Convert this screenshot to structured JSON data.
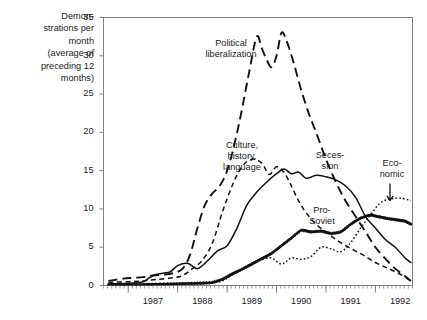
{
  "chart_data": {
    "type": "line",
    "title": "",
    "ylabel": "Demon-strations per month (average of preceding 12 months)",
    "ylabel_lines": [
      "Demon-",
      "strations per",
      "month",
      "(average of",
      "preceding 12",
      "months)"
    ],
    "xlabel": "",
    "ylim": [
      0,
      35
    ],
    "yticks": [
      0,
      5,
      10,
      15,
      20,
      25,
      30,
      35
    ],
    "xlim": [
      1986.5,
      1992.75
    ],
    "xticks": [
      1987,
      1988,
      1989,
      1990,
      1991,
      1992
    ],
    "xtick_labels": [
      "1987",
      "1988",
      "1989",
      "1990",
      "1991",
      "1992"
    ],
    "grid": false,
    "legend_position": "inline-annotations",
    "annotations": [
      {
        "name": "political-liberalization",
        "lines": [
          "Political",
          "liberalization"
        ],
        "x": 231,
        "y": 38
      },
      {
        "name": "culture-history-language",
        "lines": [
          "Culture,",
          "history,",
          "language"
        ],
        "x": 242,
        "y": 140
      },
      {
        "name": "secession",
        "lines": [
          "Seces-",
          "sion"
        ],
        "x": 330,
        "y": 150
      },
      {
        "name": "pro-soviet",
        "lines": [
          "Pro-",
          "Soviet"
        ],
        "x": 322,
        "y": 205
      },
      {
        "name": "economic",
        "lines": [
          "Eco-",
          "nomic"
        ],
        "x": 392,
        "y": 158,
        "arrow": true
      }
    ],
    "series": [
      {
        "name": "Political liberalization",
        "style": "long-dash",
        "x": [
          1986.6,
          1986.9,
          1987.1,
          1987.3,
          1987.5,
          1987.7,
          1987.9,
          1988.1,
          1988.25,
          1988.4,
          1988.55,
          1988.7,
          1988.85,
          1989.0,
          1989.15,
          1989.3,
          1989.45,
          1989.6,
          1989.7,
          1989.8,
          1989.9,
          1990.0,
          1990.1,
          1990.2,
          1990.35,
          1990.5,
          1990.65,
          1990.8,
          1991.0,
          1991.2,
          1991.4,
          1991.6,
          1991.8,
          1992.0,
          1992.2,
          1992.4,
          1992.6,
          1992.72
        ],
        "values": [
          0.6,
          0.9,
          1.0,
          1.1,
          1.3,
          1.4,
          1.6,
          2.2,
          4.0,
          7.5,
          10.5,
          12.0,
          13.0,
          15.0,
          18.5,
          23.0,
          28.0,
          32.5,
          31.0,
          29.5,
          28.5,
          30.0,
          33.0,
          32.0,
          29.0,
          25.5,
          22.5,
          20.0,
          16.5,
          13.5,
          11.0,
          9.0,
          7.0,
          5.0,
          3.5,
          2.2,
          1.2,
          0.6
        ]
      },
      {
        "name": "Culture, history, language",
        "style": "medium-dash",
        "x": [
          1986.6,
          1987.0,
          1987.3,
          1987.6,
          1987.9,
          1988.1,
          1988.3,
          1988.5,
          1988.7,
          1988.9,
          1989.1,
          1989.3,
          1989.5,
          1989.7,
          1989.85,
          1990.0,
          1990.15,
          1990.3,
          1990.45,
          1990.6,
          1990.8,
          1991.0,
          1991.2,
          1991.4,
          1991.6,
          1991.8,
          1992.0,
          1992.2,
          1992.4,
          1992.6,
          1992.72
        ],
        "values": [
          0.4,
          0.5,
          0.6,
          0.8,
          1.0,
          1.3,
          2.2,
          3.3,
          5.5,
          9.5,
          13.0,
          15.5,
          16.5,
          16.0,
          14.5,
          15.5,
          14.8,
          13.0,
          11.0,
          9.5,
          8.0,
          7.0,
          6.0,
          5.2,
          4.5,
          3.8,
          3.0,
          2.4,
          1.8,
          1.1,
          0.5
        ]
      },
      {
        "name": "Secession",
        "style": "solid",
        "x": [
          1986.6,
          1987.0,
          1987.3,
          1987.5,
          1987.7,
          1987.85,
          1988.0,
          1988.2,
          1988.4,
          1988.6,
          1988.8,
          1989.0,
          1989.2,
          1989.4,
          1989.6,
          1989.8,
          1990.0,
          1990.15,
          1990.3,
          1990.45,
          1990.6,
          1990.8,
          1991.0,
          1991.2,
          1991.4,
          1991.6,
          1991.8,
          1992.0,
          1992.2,
          1992.4,
          1992.6,
          1992.72
        ],
        "values": [
          0.2,
          0.3,
          0.5,
          1.3,
          1.6,
          1.8,
          2.6,
          2.9,
          2.2,
          3.2,
          4.5,
          5.2,
          7.5,
          10.5,
          12.2,
          13.5,
          14.6,
          15.2,
          14.6,
          14.8,
          14.0,
          14.4,
          14.2,
          13.8,
          13.0,
          11.5,
          9.0,
          7.5,
          6.0,
          5.0,
          3.6,
          3.0
        ]
      },
      {
        "name": "Pro-Soviet",
        "style": "thick-marked",
        "x": [
          1986.6,
          1987.0,
          1987.4,
          1987.8,
          1988.1,
          1988.4,
          1988.7,
          1988.9,
          1989.1,
          1989.3,
          1989.5,
          1989.7,
          1989.9,
          1990.1,
          1990.3,
          1990.5,
          1990.7,
          1990.9,
          1991.1,
          1991.3,
          1991.5,
          1991.7,
          1991.9,
          1992.05,
          1992.2,
          1992.4,
          1992.6,
          1992.72
        ],
        "values": [
          0.1,
          0.1,
          0.15,
          0.2,
          0.25,
          0.3,
          0.4,
          0.8,
          1.5,
          2.1,
          2.8,
          3.5,
          4.2,
          5.2,
          6.2,
          7.2,
          7.0,
          7.1,
          6.8,
          7.0,
          8.0,
          8.8,
          9.2,
          9.0,
          8.8,
          8.6,
          8.4,
          8.0
        ]
      },
      {
        "name": "Economic",
        "style": "dotted",
        "x": [
          1986.6,
          1987.2,
          1987.8,
          1988.2,
          1988.6,
          1988.9,
          1989.1,
          1989.3,
          1989.5,
          1989.7,
          1989.9,
          1990.1,
          1990.3,
          1990.5,
          1990.7,
          1990.9,
          1991.1,
          1991.3,
          1991.5,
          1991.7,
          1991.9,
          1992.1,
          1992.3,
          1992.5,
          1992.72
        ],
        "values": [
          0.1,
          0.1,
          0.15,
          0.2,
          0.3,
          0.6,
          1.4,
          2.2,
          2.9,
          3.4,
          3.6,
          2.8,
          3.6,
          3.4,
          3.8,
          5.0,
          4.8,
          4.4,
          5.6,
          7.5,
          9.2,
          10.8,
          11.3,
          11.4,
          11.1
        ]
      }
    ]
  }
}
